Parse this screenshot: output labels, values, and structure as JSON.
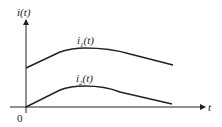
{
  "diagram": {
    "y_axis_label": "i(t)",
    "x_axis_label": "t",
    "origin_label": "0",
    "curves": [
      {
        "name": "i1(t)",
        "label_main": "i",
        "label_sub": "1",
        "label_tail": "(t)"
      },
      {
        "name": "i2(t)",
        "label_main": "i",
        "label_sub": "2",
        "label_tail": "(t)"
      }
    ],
    "colors": {
      "line": "#222222",
      "background": "#ffffff"
    }
  }
}
